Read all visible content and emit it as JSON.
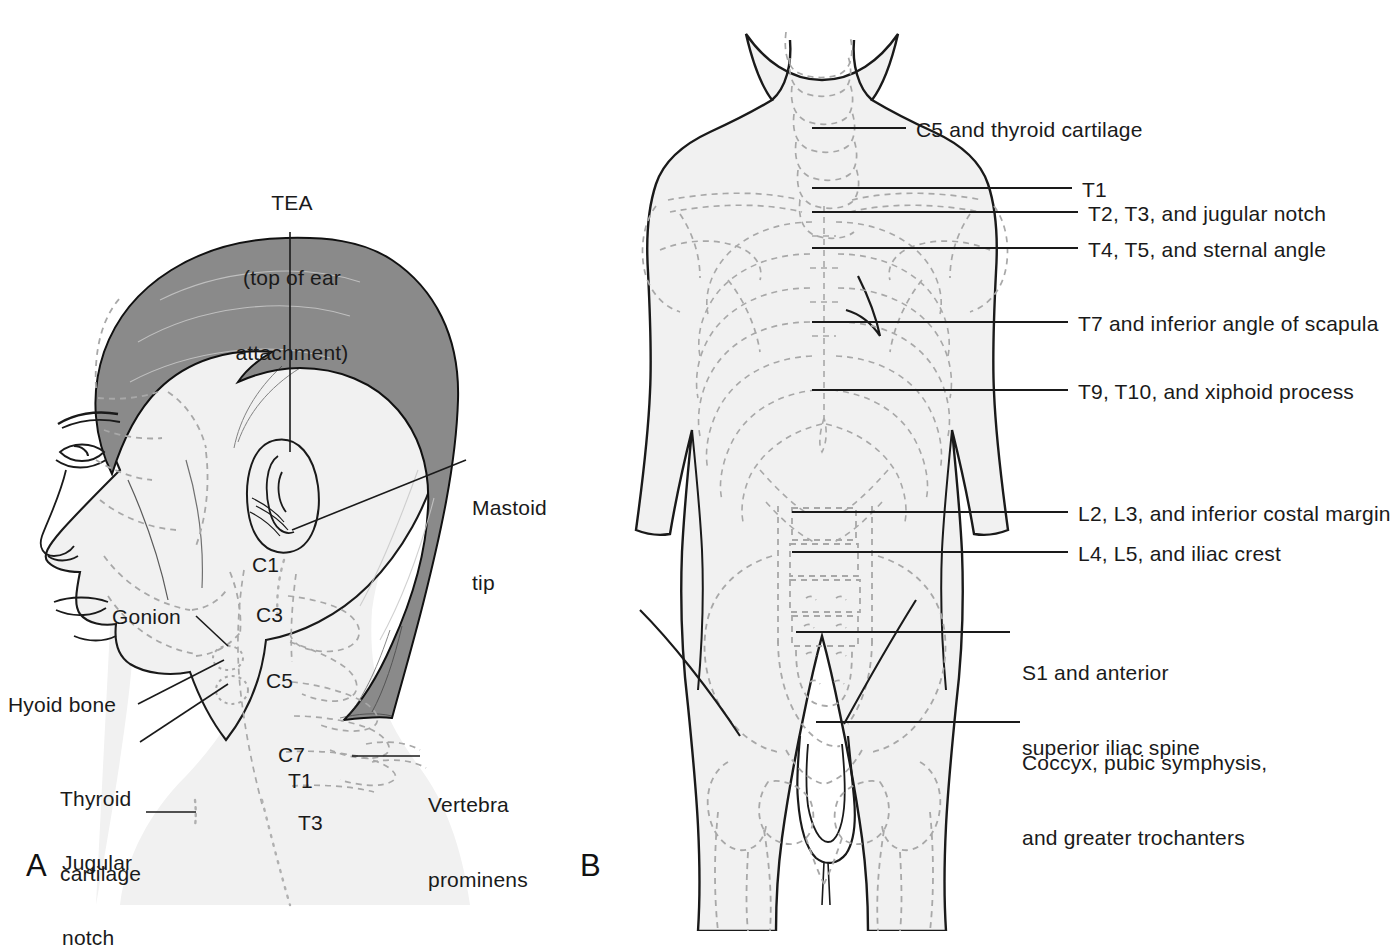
{
  "figure": {
    "background_color": "#ffffff",
    "ink_color": "#1a1a1a",
    "skin_fill": "#f1f1f1",
    "hair_fill": "#8a8a8a",
    "bone_dash_color": "#a8a8a8"
  },
  "panels": [
    {
      "letter": "A",
      "name": "lateral-head-and-neck",
      "description": "Lateral view of head and neck with cervical and upper thoracic vertebral levels"
    },
    {
      "letter": "B",
      "name": "anterior-trunk",
      "description": "Anterior view of trunk with vertebral levels and surface landmarks"
    }
  ],
  "panel_a": {
    "letter": "A",
    "labels": {
      "tea_line1": "TEA",
      "tea_line2": "(top of ear",
      "tea_line3": "attachment)",
      "mastoid_line1": "Mastoid",
      "mastoid_line2": "tip",
      "gonion": "Gonion",
      "hyoid": "Hyoid bone",
      "thyroid_line1": "Thyroid",
      "thyroid_line2": "cartilage",
      "jugular_line1": "Jugular",
      "jugular_line2": "notch",
      "vertebra_line1": "Vertebra",
      "vertebra_line2": "prominens"
    },
    "vertebra_marks": [
      {
        "id": "c1",
        "text": "C1"
      },
      {
        "id": "c3",
        "text": "C3"
      },
      {
        "id": "c5",
        "text": "C5"
      },
      {
        "id": "c7",
        "text": "C7"
      },
      {
        "id": "t1",
        "text": "T1"
      },
      {
        "id": "t3",
        "text": "T3"
      }
    ]
  },
  "panel_b": {
    "letter": "B",
    "labels": [
      {
        "id": "c5-thyroid",
        "text": "C5 and thyroid cartilage"
      },
      {
        "id": "t1",
        "text": "T1"
      },
      {
        "id": "t2-t3",
        "text": "T2, T3, and jugular notch"
      },
      {
        "id": "t4-t5",
        "text": "T4, T5, and sternal angle"
      },
      {
        "id": "t7",
        "text": "T7 and inferior angle of scapula"
      },
      {
        "id": "t9-t10",
        "text": "T9, T10, and xiphoid process"
      },
      {
        "id": "l2-l3",
        "text": "L2, L3, and inferior costal margin"
      },
      {
        "id": "l4-l5",
        "text": "L4, L5, and iliac crest"
      },
      {
        "id": "s1-line1",
        "text": "S1 and anterior"
      },
      {
        "id": "s1-line2",
        "text": "superior iliac spine"
      },
      {
        "id": "coccyx-line1",
        "text": "Coccyx, pubic symphysis,"
      },
      {
        "id": "coccyx-line2",
        "text": "and greater trochanters"
      }
    ]
  }
}
